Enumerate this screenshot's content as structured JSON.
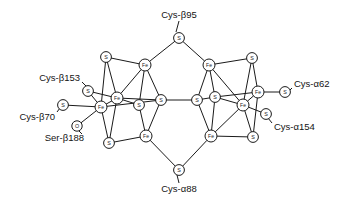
{
  "figure": {
    "name": "femo-cofactor-diagram",
    "width": 343,
    "height": 204,
    "background": "#ffffff",
    "line_color": "#1a1a1a",
    "text_color": "#141414"
  },
  "atoms": [
    {
      "id": "S_top",
      "label": "S",
      "kind": "S",
      "x": 179,
      "y": 38
    },
    {
      "id": "S_lt",
      "label": "S",
      "kind": "S",
      "x": 106,
      "y": 57
    },
    {
      "id": "Fe_lt",
      "label": "Fe",
      "kind": "Fe",
      "x": 145,
      "y": 65
    },
    {
      "id": "S_b153",
      "label": "S",
      "kind": "S",
      "x": 88,
      "y": 91
    },
    {
      "id": "Fe_lmu",
      "label": "Fe",
      "kind": "Fe",
      "x": 117,
      "y": 98
    },
    {
      "id": "Fe_lml",
      "label": "Fe",
      "kind": "Fe",
      "x": 101,
      "y": 107
    },
    {
      "id": "S_b70",
      "label": "S",
      "kind": "S",
      "x": 63,
      "y": 105
    },
    {
      "id": "O_b188",
      "label": "O",
      "kind": "O",
      "x": 77,
      "y": 126
    },
    {
      "id": "S_lc",
      "label": "S",
      "kind": "S",
      "x": 139,
      "y": 105
    },
    {
      "id": "S_lcentral",
      "label": "S",
      "kind": "S",
      "x": 161,
      "y": 100
    },
    {
      "id": "S_lb",
      "label": "S",
      "kind": "S",
      "x": 109,
      "y": 143
    },
    {
      "id": "Fe_lbot",
      "label": "Fe",
      "kind": "Fe",
      "x": 146,
      "y": 136
    },
    {
      "id": "S_bot",
      "label": "S",
      "kind": "S",
      "x": 179,
      "y": 170
    },
    {
      "id": "Fe_rt",
      "label": "Fe",
      "kind": "Fe",
      "x": 209,
      "y": 65
    },
    {
      "id": "S_rt",
      "label": "S",
      "kind": "S",
      "x": 252,
      "y": 58
    },
    {
      "id": "S_rcentral",
      "label": "S",
      "kind": "S",
      "x": 197,
      "y": 100
    },
    {
      "id": "S_rc",
      "label": "S",
      "kind": "S",
      "x": 215,
      "y": 97
    },
    {
      "id": "Fe_rmu",
      "label": "Fe",
      "kind": "Fe",
      "x": 258,
      "y": 92
    },
    {
      "id": "Fe_rml",
      "label": "Fe",
      "kind": "Fe",
      "x": 243,
      "y": 105
    },
    {
      "id": "S_a62",
      "label": "S",
      "kind": "S",
      "x": 285,
      "y": 92
    },
    {
      "id": "S_a154",
      "label": "S",
      "kind": "S",
      "x": 266,
      "y": 114
    },
    {
      "id": "Fe_rbot",
      "label": "Fe",
      "kind": "Fe",
      "x": 211,
      "y": 136
    },
    {
      "id": "S_rb",
      "label": "S",
      "kind": "S",
      "x": 253,
      "y": 137
    }
  ],
  "bonds": [
    [
      "S_top",
      "Fe_lt"
    ],
    [
      "S_top",
      "Fe_rt"
    ],
    [
      "S_lt",
      "Fe_lt"
    ],
    [
      "S_lt",
      "Fe_lmu"
    ],
    [
      "S_lt",
      "Fe_lml"
    ],
    [
      "Fe_lt",
      "S_lc"
    ],
    [
      "Fe_lt",
      "S_lcentral"
    ],
    [
      "Fe_lt",
      "Fe_lmu"
    ],
    [
      "S_b153",
      "Fe_lmu"
    ],
    [
      "S_b153",
      "Fe_lml"
    ],
    [
      "Fe_lmu",
      "Fe_lml"
    ],
    [
      "Fe_lmu",
      "S_lc"
    ],
    [
      "Fe_lmu",
      "S_lb"
    ],
    [
      "Fe_lmu",
      "S_lcentral"
    ],
    [
      "Fe_lml",
      "S_b70"
    ],
    [
      "Fe_lml",
      "O_b188"
    ],
    [
      "Fe_lml",
      "S_lb"
    ],
    [
      "Fe_lml",
      "S_lcentral"
    ],
    [
      "S_lc",
      "Fe_lbot"
    ],
    [
      "S_lcentral",
      "Fe_lbot"
    ],
    [
      "S_lcentral",
      "S_rcentral"
    ],
    [
      "S_lb",
      "Fe_lbot"
    ],
    [
      "Fe_lbot",
      "S_bot"
    ],
    [
      "S_bot",
      "Fe_rbot"
    ],
    [
      "Fe_rt",
      "S_rt"
    ],
    [
      "Fe_rt",
      "S_rc"
    ],
    [
      "Fe_rt",
      "S_rcentral"
    ],
    [
      "Fe_rt",
      "Fe_rml"
    ],
    [
      "S_rt",
      "Fe_rmu"
    ],
    [
      "S_rt",
      "Fe_rml"
    ],
    [
      "S_rcentral",
      "S_rc"
    ],
    [
      "S_rcentral",
      "Fe_rbot"
    ],
    [
      "S_rc",
      "Fe_rmu"
    ],
    [
      "S_rc",
      "Fe_rml"
    ],
    [
      "S_rc",
      "Fe_rbot"
    ],
    [
      "Fe_rmu",
      "S_a62"
    ],
    [
      "Fe_rmu",
      "Fe_rml"
    ],
    [
      "Fe_rmu",
      "S_rb"
    ],
    [
      "Fe_rml",
      "S_a154"
    ],
    [
      "Fe_rml",
      "S_rb"
    ],
    [
      "Fe_rml",
      "Fe_rbot"
    ],
    [
      "Fe_rbot",
      "S_rb"
    ]
  ],
  "residue_labels": [
    {
      "id": "cys-b95",
      "text": "Cys-β95",
      "x": 179,
      "y": 15,
      "align": "mid",
      "leader": [
        [
          179,
          21
        ],
        [
          176,
          32
        ]
      ]
    },
    {
      "id": "cys-b153",
      "text": "Cys-β153",
      "x": 80,
      "y": 78,
      "align": "end",
      "leader": [
        [
          82,
          82
        ],
        [
          87,
          87
        ]
      ]
    },
    {
      "id": "cys-b70",
      "text": "Cys-β70",
      "x": 55,
      "y": 117,
      "align": "end",
      "leader": [
        [
          57,
          112
        ],
        [
          60,
          108
        ]
      ]
    },
    {
      "id": "ser-b188",
      "text": "Ser-β188",
      "x": 84,
      "y": 138,
      "align": "end",
      "leader": [
        [
          82,
          134
        ],
        [
          78,
          130
        ]
      ]
    },
    {
      "id": "cys-a62",
      "text": "Cys-α62",
      "x": 294,
      "y": 84,
      "align": "start",
      "leader": [
        [
          292,
          88
        ],
        [
          288,
          92
        ]
      ]
    },
    {
      "id": "cys-a154",
      "text": "Cys-α154",
      "x": 274,
      "y": 127,
      "align": "start",
      "leader": [
        [
          272,
          123
        ],
        [
          268,
          118
        ]
      ]
    },
    {
      "id": "cys-a88",
      "text": "Cys-α88",
      "x": 179,
      "y": 189,
      "align": "mid",
      "leader": [
        [
          179,
          183
        ],
        [
          177,
          175
        ]
      ]
    }
  ]
}
